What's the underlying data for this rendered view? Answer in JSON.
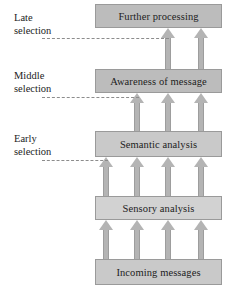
{
  "figure": {
    "type": "flow-diagram",
    "title": "",
    "background_color": "#ffffff",
    "box_fill_color": "#bdbdbd",
    "box_border_color": "#9a9a9a",
    "arrow_color": "#b4b4b4",
    "dashed_line_color": "#8c8c8c",
    "text_color": "#1c1c1c"
  },
  "stages": [
    {
      "id": "further-processing",
      "label": "Further processing",
      "tone": "tone-mid",
      "x": 95,
      "y": 4,
      "w": 127,
      "h": 24
    },
    {
      "id": "awareness-of-message",
      "label": "Awareness of message",
      "tone": "tone-mid",
      "x": 95,
      "y": 69,
      "w": 127,
      "h": 24
    },
    {
      "id": "semantic-analysis",
      "label": "Semantic analysis",
      "tone": "tone-light",
      "x": 95,
      "y": 131,
      "w": 127,
      "h": 26
    },
    {
      "id": "sensory-analysis",
      "label": "Sensory analysis",
      "tone": "tone-pale",
      "x": 95,
      "y": 196,
      "w": 127,
      "h": 24
    },
    {
      "id": "incoming-messages",
      "label": "Incoming messages",
      "tone": "tone-light",
      "x": 95,
      "y": 259,
      "w": 127,
      "h": 26
    }
  ],
  "selection_levels": [
    {
      "id": "late",
      "line1": "Late",
      "line2": "selection",
      "label_x": 14,
      "label_y": 12,
      "line_x": 42,
      "line_y": 38,
      "line_w": 127
    },
    {
      "id": "middle",
      "line1": "Middle",
      "line2": "selection",
      "label_x": 14,
      "label_y": 70,
      "line_x": 42,
      "line_y": 97,
      "line_w": 97
    },
    {
      "id": "early",
      "line1": "Early",
      "line2": "selection",
      "label_x": 14,
      "label_y": 133,
      "line_x": 42,
      "line_y": 160,
      "line_w": 66
    }
  ],
  "arrow_groups": [
    {
      "id": "awareness-to-further",
      "from": "awareness-of-message",
      "to": "further-processing",
      "count": 2,
      "top": 28,
      "height": 41,
      "xs": [
        168,
        201
      ]
    },
    {
      "id": "semantic-to-awareness",
      "from": "semantic-analysis",
      "to": "awareness-of-message",
      "count": 3,
      "top": 93,
      "height": 38,
      "xs": [
        137,
        168,
        201
      ]
    },
    {
      "id": "sensory-to-semantic",
      "from": "sensory-analysis",
      "to": "semantic-analysis",
      "count": 4,
      "top": 157,
      "height": 39,
      "xs": [
        106,
        137,
        168,
        201
      ]
    },
    {
      "id": "incoming-to-sensory",
      "from": "incoming-messages",
      "to": "sensory-analysis",
      "count": 4,
      "top": 220,
      "height": 39,
      "xs": [
        106,
        137,
        168,
        201
      ]
    }
  ]
}
